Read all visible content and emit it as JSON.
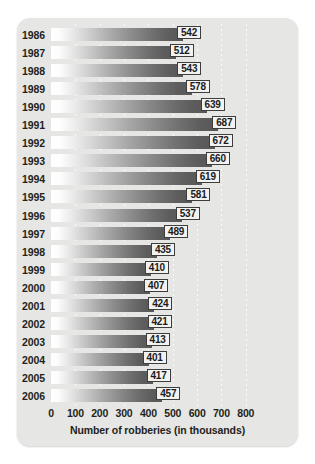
{
  "chart_data": {
    "type": "bar",
    "orientation": "horizontal",
    "title": "",
    "subtitle": "",
    "xlabel": "Number of robberies (in thousands)",
    "ylabel": "",
    "categories": [
      "1986",
      "1987",
      "1988",
      "1989",
      "1990",
      "1991",
      "1992",
      "1993",
      "1994",
      "1995",
      "1996",
      "1997",
      "1998",
      "1999",
      "2000",
      "2001",
      "2002",
      "2003",
      "2004",
      "2005",
      "2006"
    ],
    "values": [
      542,
      512,
      543,
      578,
      639,
      687,
      672,
      660,
      619,
      581,
      537,
      489,
      435,
      410,
      407,
      424,
      421,
      413,
      401,
      417,
      457
    ],
    "data_labels": [
      "542",
      "512",
      "543",
      "578",
      "639",
      "687",
      "672",
      "660",
      "619",
      "581",
      "537",
      "489",
      "435",
      "410",
      "407",
      "424",
      "421",
      "413",
      "401",
      "417",
      "457"
    ],
    "xlim": [
      0,
      800
    ],
    "xticks": [
      0,
      100,
      200,
      300,
      400,
      500,
      600,
      700,
      800
    ],
    "xtick_labels": [
      "0",
      "100",
      "200",
      "300",
      "400",
      "500",
      "600",
      "700",
      "800"
    ],
    "grid": "vertical-dotted",
    "legend": "none",
    "bar_style": "white-to-dark-gray horizontal gradient",
    "background_color": "#e6e6e4",
    "label_box_fill": "#f2f2f0",
    "label_box_border": "#3d3d3d",
    "text_color": "#231f20"
  }
}
